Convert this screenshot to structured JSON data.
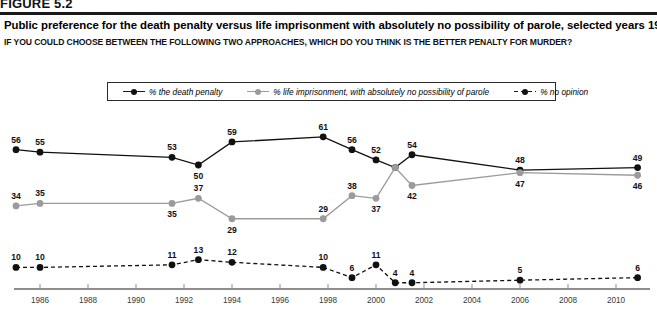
{
  "figure": {
    "tag": "FIGURE 5.2"
  },
  "header": {
    "title": "Public preference for the death penalty versus life imprisonment with absolutely no possibility of parole, selected years 1985–2010",
    "subtitle": "IF YOU COULD CHOOSE BETWEEN THE FOLLOWING TWO APPROACHES, WHICH DO YOU THINK IS THE BETTER PENALTY FOR MURDER?"
  },
  "legend": [
    {
      "label": "% the death penalty",
      "color": "#111111",
      "style": "solid"
    },
    {
      "label": "% life imprisonment, with absolutely no possibility of parole",
      "color": "#9b9b9b",
      "style": "solid"
    },
    {
      "label": "% no opinion",
      "color": "#111111",
      "style": "dashed"
    }
  ],
  "chart_data": {
    "type": "line",
    "title": "Public preference for the death penalty versus life imprisonment with absolutely no possibility of parole, selected years 1985–2010",
    "subtitle": "IF YOU COULD CHOOSE BETWEEN THE FOLLOWING TWO APPROACHES, WHICH DO YOU THINK IS THE BETTER PENALTY FOR MURDER?",
    "xlabel": "",
    "ylabel": "",
    "xlim": [
      1984.6,
      1011.4
    ],
    "ylim": [
      0,
      70
    ],
    "grid": false,
    "legend_position": "top-center",
    "x_ticks": [
      1986,
      1988,
      1990,
      1992,
      1994,
      1996,
      1998,
      2000,
      2002,
      2004,
      2006,
      2008,
      2010
    ],
    "x_tick_labels": [
      "1986",
      "1988",
      "1990",
      "1992",
      "1994",
      "1996",
      "1998",
      "2000",
      "2002",
      "2004",
      "2006",
      "2008",
      "2010"
    ],
    "series": [
      {
        "name": "% the death penalty",
        "color": "#111111",
        "style": "solid",
        "points": [
          {
            "x": 1985.0,
            "y": 56,
            "label": "56",
            "label_pos": "above"
          },
          {
            "x": 1986.0,
            "y": 55,
            "label": "55",
            "label_pos": "above"
          },
          {
            "x": 1991.5,
            "y": 53,
            "label": "53",
            "label_pos": "above"
          },
          {
            "x": 1992.6,
            "y": 50,
            "label": "50",
            "label_pos": "below"
          },
          {
            "x": 1994.0,
            "y": 59,
            "label": "59",
            "label_pos": "above"
          },
          {
            "x": 1997.8,
            "y": 61,
            "label": "61",
            "label_pos": "above"
          },
          {
            "x": 1999.0,
            "y": 56,
            "label": "56",
            "label_pos": "above"
          },
          {
            "x": 2000.0,
            "y": 52,
            "label": "52",
            "label_pos": "above"
          },
          {
            "x": 2000.8,
            "y": 49,
            "label": "",
            "label_pos": "none"
          },
          {
            "x": 2001.5,
            "y": 54,
            "label": "54",
            "label_pos": "above"
          },
          {
            "x": 2006.0,
            "y": 48,
            "label": "48",
            "label_pos": "above"
          },
          {
            "x": 2010.9,
            "y": 49,
            "label": "49",
            "label_pos": "above"
          }
        ]
      },
      {
        "name": "% life imprisonment, with absolutely no possibility of parole",
        "color": "#9b9b9b",
        "style": "solid",
        "points": [
          {
            "x": 1985.0,
            "y": 34,
            "label": "34",
            "label_pos": "above"
          },
          {
            "x": 1986.0,
            "y": 35,
            "label": "35",
            "label_pos": "above"
          },
          {
            "x": 1991.5,
            "y": 35,
            "label": "35",
            "label_pos": "below"
          },
          {
            "x": 1992.6,
            "y": 37,
            "label": "37",
            "label_pos": "above"
          },
          {
            "x": 1994.0,
            "y": 29,
            "label": "29",
            "label_pos": "below"
          },
          {
            "x": 1997.8,
            "y": 29,
            "label": "29",
            "label_pos": "above"
          },
          {
            "x": 1999.0,
            "y": 38,
            "label": "38",
            "label_pos": "above"
          },
          {
            "x": 2000.0,
            "y": 37,
            "label": "37",
            "label_pos": "below"
          },
          {
            "x": 2000.8,
            "y": 49,
            "label": "",
            "label_pos": "none"
          },
          {
            "x": 2001.5,
            "y": 42,
            "label": "42",
            "label_pos": "below"
          },
          {
            "x": 2006.0,
            "y": 47,
            "label": "47",
            "label_pos": "below"
          },
          {
            "x": 2010.9,
            "y": 46,
            "label": "46",
            "label_pos": "below"
          }
        ]
      },
      {
        "name": "% no opinion",
        "color": "#111111",
        "style": "dashed",
        "points": [
          {
            "x": 1985.0,
            "y": 10,
            "label": "10",
            "label_pos": "above"
          },
          {
            "x": 1986.0,
            "y": 10,
            "label": "10",
            "label_pos": "above"
          },
          {
            "x": 1991.5,
            "y": 11,
            "label": "11",
            "label_pos": "above"
          },
          {
            "x": 1992.6,
            "y": 13,
            "label": "13",
            "label_pos": "above"
          },
          {
            "x": 1994.0,
            "y": 12,
            "label": "12",
            "label_pos": "above"
          },
          {
            "x": 1997.8,
            "y": 10,
            "label": "10",
            "label_pos": "above"
          },
          {
            "x": 1999.0,
            "y": 6,
            "label": "6",
            "label_pos": "above"
          },
          {
            "x": 2000.0,
            "y": 11,
            "label": "11",
            "label_pos": "above"
          },
          {
            "x": 2000.8,
            "y": 4,
            "label": "4",
            "label_pos": "above"
          },
          {
            "x": 2001.5,
            "y": 4,
            "label": "4",
            "label_pos": "above"
          },
          {
            "x": 2006.0,
            "y": 5,
            "label": "5",
            "label_pos": "above"
          },
          {
            "x": 2010.9,
            "y": 6,
            "label": "6",
            "label_pos": "above"
          }
        ]
      }
    ]
  }
}
